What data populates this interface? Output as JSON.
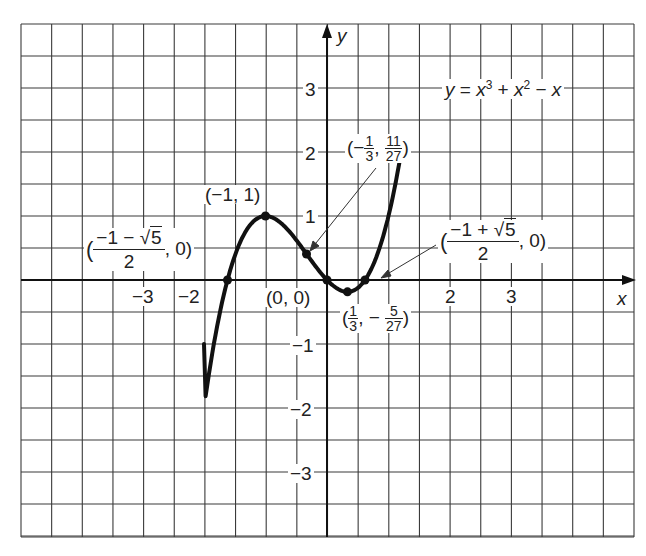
{
  "chart_data": {
    "type": "line",
    "equation_label": "y = x3 + x2 − x",
    "xlabel": "x",
    "ylabel": "y",
    "xlim": [
      -5,
      5
    ],
    "ylim": [
      -4,
      4
    ],
    "grid": true,
    "grid_step": 0.5,
    "x_ticks": [
      "−3",
      "−2",
      "2",
      "3"
    ],
    "y_ticks": [
      "3",
      "2",
      "1",
      "−1",
      "−2",
      "−3"
    ],
    "function": "x^3 + x^2 - x",
    "series": [
      {
        "name": "y = x^3 + x^2 - x",
        "x": [
          -2.0,
          -1.618,
          -1.0,
          -0.333,
          0.0,
          0.333,
          0.618,
          1.2
        ],
        "y": [
          -1.0,
          0.0,
          1.0,
          0.407,
          0.0,
          -0.185,
          0.0,
          1.2
        ]
      }
    ],
    "annotations": [
      {
        "point": "(-1, 1)",
        "x": -1,
        "y": 1,
        "label": "(−1, 1)"
      },
      {
        "point": "(-1/3, 11/27)",
        "x": -0.333,
        "y": 0.407,
        "label": "(−1/3, 11/27)"
      },
      {
        "point": "(0, 0)",
        "x": 0,
        "y": 0,
        "label": "(0, 0)"
      },
      {
        "point": "(1/3, -5/27)",
        "x": 0.333,
        "y": -0.185,
        "label": "(1/3, −5/27)"
      },
      {
        "point": "((-1-√5)/2, 0)",
        "x": -1.618,
        "y": 0,
        "label": "((−1 − √5)/2, 0)"
      },
      {
        "point": "((-1+√5)/2, 0)",
        "x": 0.618,
        "y": 0,
        "label": "((−1 + √5)/2, 0)"
      }
    ]
  },
  "labels": {
    "axis_x": "x",
    "axis_y": "y",
    "eq_y": "y",
    "eq_eq": " = ",
    "eq_x1": "x",
    "eq_p1": "3",
    "eq_plus": " + ",
    "eq_x2": "x",
    "eq_p2": "2",
    "eq_minus": " − ",
    "eq_x3": "x",
    "ticks": {
      "xm3": "−3",
      "xm2": "−2",
      "x2": "2",
      "x3": "3",
      "y3": "3",
      "y2": "2",
      "y1": "1",
      "ym1": "−1",
      "ym2": "−2",
      "ym3": "−3"
    },
    "max_pt": "(−1, 1)",
    "origin_pt": "(0, 0)",
    "infl": {
      "open": "(−",
      "n1": "1",
      "d1": "3",
      "comma": ",",
      "n2": "11",
      "d2": "27",
      "close": ")"
    },
    "min": {
      "open": "(",
      "n1": "1",
      "d1": "3",
      "comma": ", −",
      "n2": "5",
      "d2": "27",
      "close": ")"
    },
    "root_left": {
      "open": "(",
      "num_a": "−1 − ",
      "num_sqrt": "5",
      "den": "2",
      "tail": ", 0)"
    },
    "root_right": {
      "open": "(",
      "num_a": "−1 + ",
      "num_sqrt": "5",
      "den": "2",
      "tail": ", 0)"
    }
  }
}
